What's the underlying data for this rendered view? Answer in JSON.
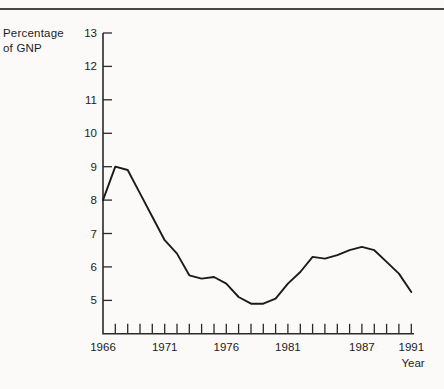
{
  "figure": {
    "y_axis_label_line1": "Percentage",
    "y_axis_label_line2": "of GNP",
    "x_axis_label": "Year"
  },
  "chart_data": {
    "type": "line",
    "title": "",
    "ylabel": "Percentage of GNP",
    "xlabel": "Year",
    "x": [
      1966,
      1967,
      1968,
      1969,
      1970,
      1971,
      1972,
      1973,
      1974,
      1975,
      1976,
      1977,
      1978,
      1979,
      1980,
      1981,
      1982,
      1983,
      1984,
      1985,
      1986,
      1987,
      1988,
      1989,
      1990,
      1991
    ],
    "values": [
      8.0,
      9.0,
      8.9,
      8.2,
      7.5,
      6.8,
      6.4,
      5.75,
      5.65,
      5.7,
      5.5,
      5.1,
      4.9,
      4.9,
      5.05,
      5.5,
      5.85,
      6.3,
      6.25,
      6.35,
      6.5,
      6.6,
      6.5,
      6.15,
      5.8,
      5.25
    ],
    "y_ticks": [
      5,
      6,
      7,
      8,
      9,
      10,
      11,
      12,
      13
    ],
    "x_tick_labels": [
      "1966",
      "1971",
      "1976",
      "1981",
      "1987",
      "1991"
    ],
    "xlim": [
      1966,
      1991
    ],
    "ylim": [
      4,
      13
    ],
    "grid": false,
    "legend": "none",
    "minor_x_ticks": "one per year",
    "line_color": "#1b1b1b",
    "background_color": "#fbfaf8"
  }
}
